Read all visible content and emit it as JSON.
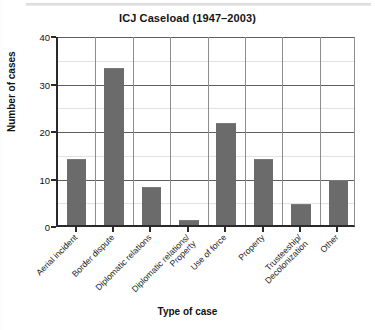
{
  "chart_data": {
    "type": "bar",
    "title": "ICJ Caseload (1947–2003)",
    "xlabel": "Type of case",
    "ylabel": "Number of cases",
    "categories": [
      "Aerial incident",
      "Border dispute",
      "Diplomatic relations",
      "Diplomatic relations/ Property",
      "Use of force",
      "Property",
      "Trusteeship/ Decolonization",
      "Other"
    ],
    "category_lines": [
      [
        "Aerial incident"
      ],
      [
        "Border dispute"
      ],
      [
        "Diplomatic relations"
      ],
      [
        "Diplomatic relations/",
        "Property"
      ],
      [
        "Use of force"
      ],
      [
        "Property"
      ],
      [
        "Trusteeship/",
        "Decolonization"
      ],
      [
        "Other"
      ]
    ],
    "values": [
      14,
      33,
      8,
      1,
      21.5,
      14,
      4.5,
      9.5
    ],
    "ylim": [
      0,
      40
    ],
    "ytick_labels": [
      "0",
      "10",
      "20",
      "30",
      "40"
    ],
    "ytick_values": [
      0,
      10,
      20,
      30,
      40
    ],
    "minor_gridline_values": [
      5,
      15,
      25,
      35
    ],
    "grid": true,
    "legend": "none",
    "bar_color": "#6b6b6b",
    "axis_color": "#2a2a2a",
    "gridline_color": "#5e5e5e"
  }
}
